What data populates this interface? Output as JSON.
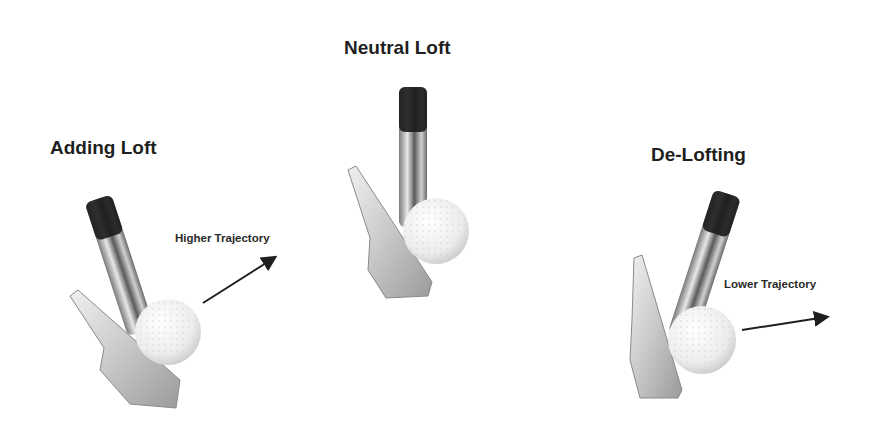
{
  "diagram": {
    "panels": [
      {
        "id": "adding-loft",
        "title": "Adding Loft",
        "trajectory_label": "Higher Trajectory",
        "arrow_direction": "up-right"
      },
      {
        "id": "neutral-loft",
        "title": "Neutral Loft",
        "trajectory_label": null,
        "arrow_direction": null
      },
      {
        "id": "de-lofting",
        "title": "De-Lofting",
        "trajectory_label": "Lower Trajectory",
        "arrow_direction": "right-slightly-up"
      }
    ],
    "colors": {
      "background": "#ffffff",
      "text": "#1f1f1f",
      "grip": "#1a1a1a",
      "shaft": "#b8b8b8",
      "clubhead": "#d6d6d6",
      "ball": "#f2f2f2",
      "arrow": "#1f1f1f"
    }
  }
}
